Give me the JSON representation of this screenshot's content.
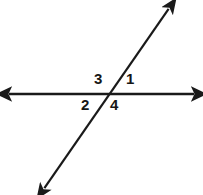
{
  "figure": {
    "background_color": "#ffffff",
    "stroke_color": "#1a1a1a",
    "label_color": "#161616"
  },
  "labels": {
    "angle1": "1",
    "angle2": "2",
    "angle3": "3",
    "angle4": "4"
  },
  "geometry": {
    "horizontal_line": {
      "name": "horizontal-line",
      "x1": 7,
      "y1": 94,
      "x2": 196,
      "y2": 94,
      "stroke_width": 2.6,
      "arrow_start": true,
      "arrow_end": true
    },
    "diagonal_line": {
      "name": "diagonal-line",
      "x1": 43,
      "y1": 190,
      "x2": 170,
      "y2": 7,
      "stroke_width": 2.2,
      "arrow_start": true,
      "arrow_end": true
    },
    "intersection": {
      "x": 108,
      "y": 94
    }
  },
  "label_positions": {
    "angle1": {
      "x": 126,
      "y": 71
    },
    "angle2": {
      "x": 81,
      "y": 97
    },
    "angle3": {
      "x": 94,
      "y": 71
    },
    "angle4": {
      "x": 110,
      "y": 97
    }
  }
}
